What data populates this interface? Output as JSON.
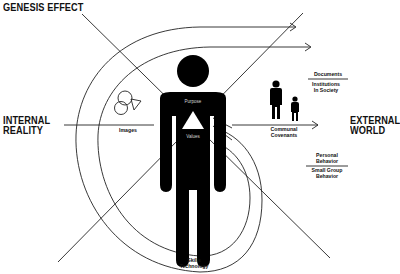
{
  "diagram": {
    "title": "GENESIS EFFECT",
    "left_label": {
      "line1": "INTERNAL",
      "line2": "REALITY"
    },
    "right_label": {
      "line1": "EXTERNAL",
      "line2": "WORLD"
    },
    "figure": {
      "upper_text": "Purpose",
      "lower_text": "Values",
      "icon": "triangle-icon"
    },
    "labels": {
      "images": "Images",
      "communal_covenants": {
        "line1": "Communal",
        "line2": "Covenants"
      },
      "documents": "Documents",
      "institutions": {
        "line1": "Institutions",
        "line2": "In Society"
      },
      "personal_behavior": {
        "line1": "Personal",
        "line2": "Behavior"
      },
      "small_group_behavior": {
        "line1": "Small Group",
        "line2": "Behavior"
      },
      "skills_technology": {
        "line1": "Skills",
        "line2": "Technology"
      }
    },
    "icons": [
      "person-icon",
      "adult-child-icon",
      "overlapping-shapes-icon",
      "arrow-icon"
    ],
    "colors": {
      "ink": "#111111",
      "background": "#ffffff"
    }
  }
}
